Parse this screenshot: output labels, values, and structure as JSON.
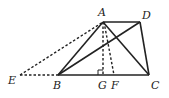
{
  "diagram": {
    "points": {
      "A": {
        "label": "A",
        "x": 103,
        "y": 22
      },
      "D": {
        "label": "D",
        "x": 140,
        "y": 22
      },
      "B": {
        "label": "B",
        "x": 58,
        "y": 75
      },
      "C": {
        "label": "C",
        "x": 149,
        "y": 75
      },
      "E": {
        "label": "E",
        "x": 20,
        "y": 75
      },
      "G": {
        "label": "G",
        "x": 103,
        "y": 75
      },
      "F": {
        "label": "F",
        "x": 114,
        "y": 75
      }
    },
    "solid_segments": [
      "AD",
      "DC",
      "BC",
      "AB",
      "AC",
      "BD"
    ],
    "dashed_segments": [
      "EA",
      "EB",
      "AG",
      "AF"
    ],
    "right_angle_at": "G",
    "colors": {
      "stroke": "#222222",
      "background": "#ffffff"
    }
  }
}
